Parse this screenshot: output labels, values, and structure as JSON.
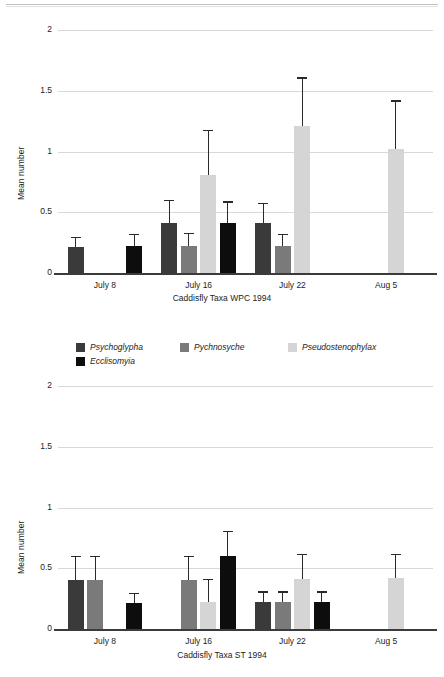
{
  "figure": {
    "ylabel": "Mean number",
    "ytick_labels": [
      "0",
      "0.5",
      "1",
      "1.5",
      "2"
    ],
    "xtick_labels": [
      "July 8",
      "July 16",
      "July 22",
      "Aug 5"
    ]
  },
  "legend": {
    "items": [
      {
        "label": "Psychoglypha",
        "color": "#3a3a3a"
      },
      {
        "label": "Pychnosyche",
        "color": "#7a7a7a"
      },
      {
        "label": "Pseudostenophylax",
        "color": "#d5d5d5"
      },
      {
        "label": "Ecclisomyia",
        "color": "#0d0d0d"
      }
    ]
  },
  "colors": {
    "psychoglypha": "#3a3a3a",
    "pychnosyche": "#7a7a7a",
    "pseudostenophylax": "#d5d5d5",
    "ecclisomyia": "#0d0d0d",
    "grid": "#d8d8d8",
    "axis": "#3b3b3b",
    "error": "#2a2a2a"
  },
  "chart_data": [
    {
      "type": "bar",
      "id": "wpc-1994",
      "title": "",
      "xlabel": "Caddisfly Taxa WPC 1994",
      "ylabel": "Mean number",
      "ylim": [
        0,
        2
      ],
      "yticks": [
        0,
        0.5,
        1,
        1.5,
        2
      ],
      "grid": true,
      "legend_position": "below-chart",
      "categories": [
        "July 8",
        "July 16",
        "July 22",
        "Aug 5"
      ],
      "series": [
        {
          "name": "Psychoglypha",
          "values": [
            0.21,
            0.41,
            0.41,
            null
          ],
          "errors": [
            0.09,
            0.19,
            0.17,
            null
          ]
        },
        {
          "name": "Pychnosyche",
          "values": [
            null,
            0.22,
            0.22,
            null
          ],
          "errors": [
            null,
            0.11,
            0.1,
            null
          ]
        },
        {
          "name": "Pseudostenophylax",
          "values": [
            null,
            0.81,
            1.21,
            1.02
          ],
          "errors": [
            null,
            0.37,
            0.4,
            0.4
          ]
        },
        {
          "name": "Ecclisomyia",
          "values": [
            0.22,
            0.41,
            null,
            null
          ],
          "errors": [
            0.1,
            0.18,
            null,
            null
          ]
        }
      ]
    },
    {
      "type": "bar",
      "id": "st-1994",
      "title": "",
      "xlabel": "Caddisfly Taxa ST 1994",
      "ylabel": "Mean number",
      "ylim": [
        0,
        2
      ],
      "yticks": [
        0,
        0.5,
        1,
        1.5,
        2
      ],
      "grid": true,
      "legend_position": "none",
      "categories": [
        "July 8",
        "July 16",
        "July 22",
        "Aug 5"
      ],
      "series": [
        {
          "name": "Psychoglypha",
          "values": [
            0.4,
            null,
            0.22,
            null
          ],
          "errors": [
            0.2,
            null,
            0.09,
            null
          ]
        },
        {
          "name": "Pychnosyche",
          "values": [
            0.4,
            0.4,
            0.22,
            null
          ],
          "errors": [
            0.2,
            0.2,
            0.09,
            null
          ]
        },
        {
          "name": "Pseudostenophylax",
          "values": [
            null,
            0.22,
            0.41,
            0.42
          ],
          "errors": [
            null,
            0.19,
            0.21,
            0.2
          ]
        },
        {
          "name": "Ecclisomyia",
          "values": [
            0.21,
            0.6,
            0.22,
            null
          ],
          "errors": [
            0.09,
            0.21,
            0.09,
            null
          ]
        }
      ]
    }
  ]
}
